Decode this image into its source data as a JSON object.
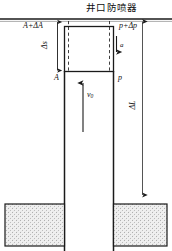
{
  "figure": {
    "title": "井口防喷器",
    "labels": {
      "area_top": "A+ΔA",
      "pressure_top": "p+Δp",
      "area_bottom": "A",
      "pressure_bottom": "p",
      "displacement": "Δs",
      "accel": "a",
      "velocity": "v",
      "velocity_sub": "0",
      "length": "ΔL"
    },
    "colors": {
      "line": "#1a1a1a",
      "dash": "#2a2a2a",
      "formation_fill": "#f0f0f0",
      "formation_stipple": "#b8b8b8",
      "background": "#ffffff"
    }
  }
}
